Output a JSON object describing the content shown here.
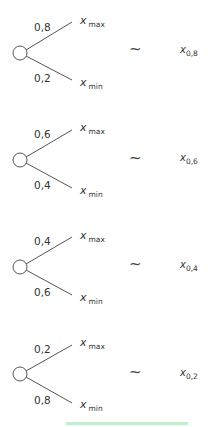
{
  "diagram": {
    "type": "lottery-certainty-equivalents",
    "outcome_labels": {
      "max": "x",
      "max_sub": "max",
      "min": "x",
      "min_sub": "min"
    },
    "equivalence_symbol": "~",
    "lotteries": [
      {
        "p_max": "0,8",
        "p_min": "0,2",
        "ce_var": "x",
        "ce_sub": "0,8"
      },
      {
        "p_max": "0,6",
        "p_min": "0,4",
        "ce_var": "x",
        "ce_sub": "0,6"
      },
      {
        "p_max": "0,4",
        "p_min": "0,6",
        "ce_var": "x",
        "ce_sub": "0,4"
      },
      {
        "p_max": "0,2",
        "p_min": "0,8",
        "ce_var": "x",
        "ce_sub": "0,2"
      }
    ],
    "colors": {
      "stroke": "#555555",
      "highlight_bar": "#bdf2c6"
    }
  }
}
